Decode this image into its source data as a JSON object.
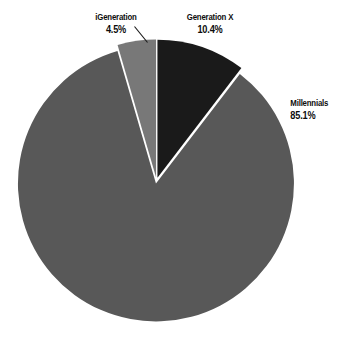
{
  "chart_data": {
    "type": "pie",
    "title": "",
    "categories": [
      "iGeneration",
      "Generation X",
      "Millennials"
    ],
    "values": [
      4.5,
      10.4,
      85.1
    ],
    "value_labels": [
      "4.5%",
      "10.4%",
      "85.1%"
    ],
    "unit": "%",
    "colors": [
      "#787878",
      "#1a1a1a",
      "#585858"
    ],
    "separator_color": "#ffffff",
    "background": "#ffffff",
    "legend": "none",
    "labels_position": "outside",
    "start_angle_deg": -16.2,
    "direction": "clockwise",
    "exploded": true,
    "grid": false
  },
  "labels": {
    "igeneration": {
      "name": "iGeneration",
      "pct": "4.5%"
    },
    "generationx": {
      "name": "Generation X",
      "pct": "10.4%"
    },
    "millennials": {
      "name": "Millennials",
      "pct": "85.1%"
    }
  },
  "icons": {
    "leader_line": "leader-line-icon"
  }
}
